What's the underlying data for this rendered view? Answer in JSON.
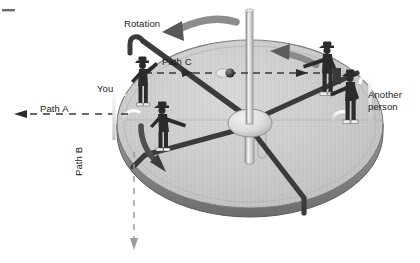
{
  "figure": {
    "labels": {
      "rotation": "Rotation",
      "path_c": "Path C",
      "you": "You",
      "path_a": "Path A",
      "path_b": "Path B",
      "another_person_line1": "Another",
      "another_person_line2": "person"
    },
    "colors": {
      "background": "#ffffff",
      "platform_fill": "#c9c9c9",
      "platform_top_highlight": "#d5d5d5",
      "platform_edge": "#6f6f6f",
      "platform_rim": "#a2a2a2",
      "spoke_dark": "#3c3c3c",
      "rail_light": "#f2f2f2",
      "hub_fill": "#d9d9d9",
      "figure_dark": "#2b2b2b",
      "arrow_gray": "#707070",
      "dash_line": "#4a4a4a",
      "text": "#1a1a1a",
      "ball_dark": "#2d2d2d",
      "ball_light": "#e8e8e8"
    },
    "elements": {
      "platform": "rotating circular merry-go-round platform drawn in perspective",
      "center_pole": "vertical central pole",
      "hub": "central hub ellipse",
      "spokes": "six radial spokes / handrail bars",
      "figures": [
        {
          "name": "you-figure",
          "description": "person standing at left of platform throwing a ball"
        },
        {
          "name": "you-figure-throwing",
          "description": "second view of you, bent forward, throwing"
        },
        {
          "name": "catcher-figure",
          "description": "person at right catching / reaching"
        },
        {
          "name": "another-person-figure",
          "description": "another person standing at far right edge"
        }
      ],
      "arrows": [
        {
          "name": "rotation-arrow",
          "description": "large curved gray arrow at top-left indicating counter-clockwise rotation"
        },
        {
          "name": "rotation-arrow-inner",
          "description": "curved gray arrow on platform near right figure"
        },
        {
          "name": "path-a-arrow",
          "description": "horizontal dashed line with left-pointing arrow head"
        },
        {
          "name": "path-b-arrow",
          "description": "vertical dashed line with downward arrow head"
        },
        {
          "name": "path-c-arrow",
          "description": "horizontal dashed line across platform with right-pointing arrow heads and a ball"
        },
        {
          "name": "throw-arrow",
          "description": "curved dark arrow from throwing figure pointing down-right"
        }
      ],
      "ball": {
        "name": "thrown-ball",
        "description": "small ball on Path C"
      }
    }
  }
}
